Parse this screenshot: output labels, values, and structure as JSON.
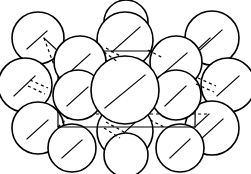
{
  "figure": {
    "type": "line-art-diagram",
    "width": 251,
    "height": 174
  },
  "style": {
    "background_color": "#ffffff",
    "sphere_fill": "#ffffff",
    "sphere_stroke": "#000000",
    "sphere_stroke_width": 1.6,
    "cell_stroke": "#000000",
    "cell_stroke_width": 1.2,
    "hidden_edge_dash": "3 3"
  },
  "unit_cell": {
    "label": "unit-cell-outline",
    "front_face": {
      "top_left": [
        58,
        51
      ],
      "top_right": [
        196,
        51
      ],
      "bottom_right": [
        195,
        127
      ],
      "bottom_left": [
        58,
        127
      ]
    },
    "depth_offset": [
      14,
      -13
    ],
    "visible_edges": [
      [
        58,
        51,
        196,
        51
      ],
      [
        196,
        51,
        195,
        127
      ],
      [
        195,
        127,
        58,
        127
      ],
      [
        58,
        127,
        58,
        51
      ]
    ],
    "depth_edges": [
      [
        58,
        51,
        44,
        38
      ],
      [
        196,
        51,
        210,
        38
      ],
      [
        195,
        127,
        209,
        114
      ]
    ],
    "hidden_edges": [
      [
        58,
        127,
        72,
        114
      ],
      [
        72,
        114,
        209,
        114
      ],
      [
        72,
        114,
        44,
        38
      ]
    ]
  },
  "atoms": {
    "count": 17,
    "radius_corner": 26,
    "radius_center": 34,
    "spheres": [
      {
        "id": "corner-back-top-left",
        "cx": 38,
        "cy": 38,
        "r": 26,
        "facet_line": [
          27,
          49,
          47,
          31
        ]
      },
      {
        "id": "edge-back-top-mid",
        "cx": 125,
        "cy": 40,
        "r": 28,
        "facet_line": [
          112,
          52,
          140,
          27
        ]
      },
      {
        "id": "corner-back-top-right",
        "cx": 212,
        "cy": 38,
        "r": 27,
        "facet_line": [
          200,
          50,
          222,
          30
        ]
      },
      {
        "id": "corner-front-top-left",
        "cx": 80,
        "cy": 62,
        "r": 26,
        "facet_line": [
          69,
          73,
          90,
          54
        ]
      },
      {
        "id": "corner-front-top-right",
        "cx": 176,
        "cy": 62,
        "r": 26,
        "facet_line": [
          164,
          73,
          187,
          53
        ]
      },
      {
        "id": "edge-mid-left-outer",
        "cx": 25,
        "cy": 85,
        "r": 27,
        "facet_line": [
          14,
          96,
          35,
          76
        ]
      },
      {
        "id": "body-center",
        "cx": 125,
        "cy": 90,
        "r": 34,
        "facet_line": [
          105,
          108,
          145,
          75
        ]
      },
      {
        "id": "edge-mid-right-outer",
        "cx": 228,
        "cy": 85,
        "r": 27,
        "facet_line": [
          217,
          96,
          239,
          76
        ]
      },
      {
        "id": "edge-mid-left-inner",
        "cx": 78,
        "cy": 95,
        "r": 25,
        "facet_line": [
          67,
          106,
          88,
          87
        ]
      },
      {
        "id": "edge-mid-right-inner",
        "cx": 176,
        "cy": 95,
        "r": 25,
        "facet_line": [
          165,
          106,
          186,
          86
        ]
      },
      {
        "id": "corner-back-bottom-left",
        "cx": 38,
        "cy": 128,
        "r": 26,
        "facet_line": [
          27,
          139,
          48,
          120
        ]
      },
      {
        "id": "edge-back-bottom-mid",
        "cx": 125,
        "cy": 131,
        "r": 28,
        "facet_line": [
          113,
          143,
          139,
          119
        ]
      },
      {
        "id": "corner-back-bottom-right",
        "cx": 212,
        "cy": 128,
        "r": 27,
        "facet_line": [
          200,
          140,
          223,
          119
        ]
      },
      {
        "id": "corner-front-bottom-left",
        "cx": 72,
        "cy": 148,
        "r": 24,
        "facet_line": [
          62,
          158,
          82,
          140
        ]
      },
      {
        "id": "corner-front-bottom-right",
        "cx": 180,
        "cy": 148,
        "r": 24,
        "facet_line": [
          170,
          158,
          190,
          139
        ]
      },
      {
        "id": "edge-front-bottom-mid",
        "cx": 126,
        "cy": 155,
        "r": 22,
        "facet_line": [
          117,
          164,
          135,
          147
        ]
      },
      {
        "id": "edge-front-top-mid",
        "cx": 126,
        "cy": 22,
        "r": 22,
        "facet_line": [
          117,
          31,
          135,
          14
        ]
      }
    ]
  },
  "interstitial_marks": {
    "description": "short dashed strokes marking interstitial voids between spheres",
    "dashes": [
      [
        106,
        48,
        122,
        57
      ],
      [
        104,
        52,
        118,
        62
      ],
      [
        148,
        50,
        163,
        58
      ],
      [
        30,
        80,
        48,
        88
      ],
      [
        28,
        86,
        45,
        94
      ],
      [
        198,
        78,
        216,
        86
      ],
      [
        196,
        84,
        214,
        92
      ],
      [
        106,
        122,
        124,
        132
      ],
      [
        104,
        128,
        120,
        138
      ],
      [
        150,
        120,
        166,
        128
      ]
    ]
  }
}
